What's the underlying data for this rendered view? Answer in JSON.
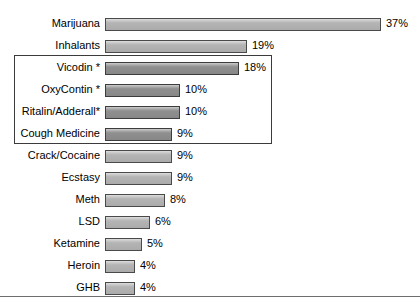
{
  "chart_data": {
    "type": "bar",
    "orientation": "horizontal",
    "title": "",
    "subtitle": "",
    "xlabel": "",
    "ylabel": "",
    "xlim": [
      0,
      37
    ],
    "grid": false,
    "legend": null,
    "value_suffix": "%",
    "categories": [
      "Marijuana",
      "Inhalants",
      "Vicodin *",
      "OxyContin *",
      "Ritalin/Adderall*",
      "Cough Medicine",
      "Crack/Cocaine",
      "Ecstasy",
      "Meth",
      "LSD",
      "Ketamine",
      "Heroin",
      "GHB"
    ],
    "values": [
      37,
      19,
      18,
      10,
      10,
      9,
      9,
      9,
      8,
      6,
      5,
      4,
      4
    ],
    "value_labels": [
      "37%",
      "19%",
      "18%",
      "10%",
      "10%",
      "9%",
      "9%",
      "9%",
      "8%",
      "6%",
      "5%",
      "4%",
      "4%"
    ],
    "bars": [
      {
        "label": "Marijuana",
        "value": 37,
        "value_label": "37%",
        "grouped": false,
        "shade": "light"
      },
      {
        "label": "Inhalants",
        "value": 19,
        "value_label": "19%",
        "grouped": false,
        "shade": "light"
      },
      {
        "label": "Vicodin *",
        "value": 18,
        "value_label": "18%",
        "grouped": true,
        "shade": "dark"
      },
      {
        "label": "OxyContin *",
        "value": 10,
        "value_label": "10%",
        "grouped": true,
        "shade": "dark"
      },
      {
        "label": "Ritalin/Adderall*",
        "value": 10,
        "value_label": "10%",
        "grouped": true,
        "shade": "dark"
      },
      {
        "label": "Cough Medicine",
        "value": 9,
        "value_label": "9%",
        "grouped": true,
        "shade": "dark"
      },
      {
        "label": "Crack/Cocaine",
        "value": 9,
        "value_label": "9%",
        "grouped": false,
        "shade": "light"
      },
      {
        "label": "Ecstasy",
        "value": 9,
        "value_label": "9%",
        "grouped": false,
        "shade": "light"
      },
      {
        "label": "Meth",
        "value": 8,
        "value_label": "8%",
        "grouped": false,
        "shade": "light"
      },
      {
        "label": "LSD",
        "value": 6,
        "value_label": "6%",
        "grouped": false,
        "shade": "light"
      },
      {
        "label": "Ketamine",
        "value": 5,
        "value_label": "5%",
        "grouped": false,
        "shade": "light"
      },
      {
        "label": "Heroin",
        "value": 4,
        "value_label": "4%",
        "grouped": false,
        "shade": "light"
      },
      {
        "label": "GHB",
        "value": 4,
        "value_label": "4%",
        "grouped": false,
        "shade": "light"
      }
    ],
    "annotations": [
      {
        "type": "group-box",
        "name": "prescription-and-otc-group-box",
        "members": [
          "Vicodin *",
          "OxyContin *",
          "Ritalin/Adderall*",
          "Cough Medicine"
        ]
      }
    ],
    "colors": {
      "bar_light": "#b4b4b4",
      "bar_dark": "#8f8f8f",
      "bar_border": "#4a4a4a",
      "group_box_border": "#3b3b3b",
      "text": "#000000",
      "baseline_rule": "#6e6e6e",
      "background": "#ffffff"
    },
    "layout": {
      "bar_origin_x": 105,
      "px_per_percent": 7.46,
      "row_height": 22,
      "first_row_y": 18,
      "bar_height": 13,
      "value_gap_px": 5
    }
  }
}
